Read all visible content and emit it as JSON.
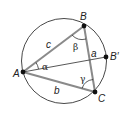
{
  "diagram": {
    "circle": {
      "cx": 64,
      "cy": 61,
      "r": 42.5
    },
    "points": {
      "A": {
        "label": "A",
        "x": 23,
        "y": 72
      },
      "B": {
        "label": "B",
        "x": 84,
        "y": 26
      },
      "C": {
        "label": "C",
        "x": 95,
        "y": 92
      },
      "Bprime": {
        "label": "B′",
        "x": 106,
        "y": 57
      }
    },
    "sides": {
      "a": "a",
      "b": "b",
      "c": "c"
    },
    "angles": {
      "alpha": "α",
      "beta": "β",
      "gamma": "γ"
    },
    "colors": {
      "triangle_edge": "#8a8a8a",
      "circle": "#333333",
      "point": "#111111",
      "text": "#222222"
    }
  }
}
